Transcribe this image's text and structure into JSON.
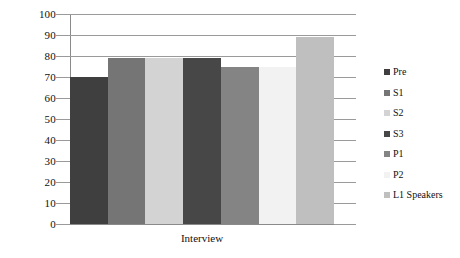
{
  "chart_data": {
    "type": "bar",
    "title": "",
    "subtitle": "",
    "xlabel": "Interview",
    "ylabel": "",
    "categories": [
      "Interview"
    ],
    "grid": true,
    "legend_position": "right",
    "ylim": [
      0,
      100
    ],
    "ytick_labels": [
      "100",
      "90",
      "80",
      "70",
      "60",
      "50",
      "40",
      "30",
      "20",
      "10",
      "0"
    ],
    "ytick_values": [
      100,
      90,
      80,
      70,
      60,
      50,
      40,
      30,
      20,
      10,
      0
    ],
    "series": [
      {
        "name": "Pre",
        "values": [
          70
        ],
        "color": "#3f3f3f"
      },
      {
        "name": "S1",
        "values": [
          79
        ],
        "color": "#757575"
      },
      {
        "name": "S2",
        "values": [
          79
        ],
        "color": "#d3d3d3"
      },
      {
        "name": "S3",
        "values": [
          79
        ],
        "color": "#474747"
      },
      {
        "name": "P1",
        "values": [
          75
        ],
        "color": "#848484"
      },
      {
        "name": "P2",
        "values": [
          75
        ],
        "color": "#f2f2f2"
      },
      {
        "name": "L1 Speakers",
        "values": [
          89
        ],
        "color": "#bfbfbf"
      }
    ]
  },
  "legend": {
    "items": [
      {
        "label": "Pre",
        "color": "#3f3f3f"
      },
      {
        "label": "S1",
        "color": "#757575"
      },
      {
        "label": "S2",
        "color": "#d3d3d3"
      },
      {
        "label": "S3",
        "color": "#474747"
      },
      {
        "label": "P1",
        "color": "#848484"
      },
      {
        "label": "P2",
        "color": "#f2f2f2"
      },
      {
        "label": "L1 Speakers",
        "color": "#bfbfbf"
      }
    ]
  },
  "axes": {
    "x_label": "Interview",
    "grid_color": "#9a9a9a"
  }
}
